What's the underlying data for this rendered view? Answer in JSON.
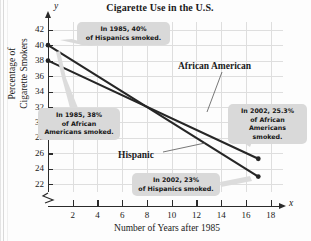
{
  "chart_data": {
    "type": "line",
    "title": "Cigarette Use in the U.S.",
    "xlabel": "Number of Years after 1985",
    "ylabel_line1": "Percentage of",
    "ylabel_line2": "Cigarette Smokers",
    "x_axis_variable": "x",
    "y_axis_variable": "y",
    "xlim": [
      0,
      19
    ],
    "ylim": [
      21,
      43
    ],
    "xticks": [
      2,
      4,
      6,
      8,
      10,
      12,
      14,
      16,
      18
    ],
    "yticks": [
      22,
      24,
      26,
      28,
      30,
      32,
      34,
      36,
      38,
      40,
      42
    ],
    "grid": true,
    "y_axis_break": true,
    "legend_position": "inline-labels",
    "series": [
      {
        "name": "Hispanic",
        "x": [
          0,
          17
        ],
        "values": [
          40,
          23
        ],
        "color": "#262626"
      },
      {
        "name": "African American",
        "x": [
          0,
          17
        ],
        "values": [
          38,
          25.3
        ],
        "color": "#262626"
      }
    ],
    "annotations": [
      {
        "id": "hispanic-1985",
        "line1": "In 1985, 40%",
        "line2": "of Hispanics smoked.",
        "line3": ""
      },
      {
        "id": "african-american-1985",
        "line1": "In 1985, 38%",
        "line2": "of African",
        "line3": "Americans smoked."
      },
      {
        "id": "african-american-2002",
        "line1": "In 2002, 25.3%",
        "line2": "of African",
        "line3": "Americans smoked."
      },
      {
        "id": "hispanic-2002",
        "line1": "In 2002, 23%",
        "line2": "of Hispanics smoked.",
        "line3": ""
      }
    ]
  }
}
